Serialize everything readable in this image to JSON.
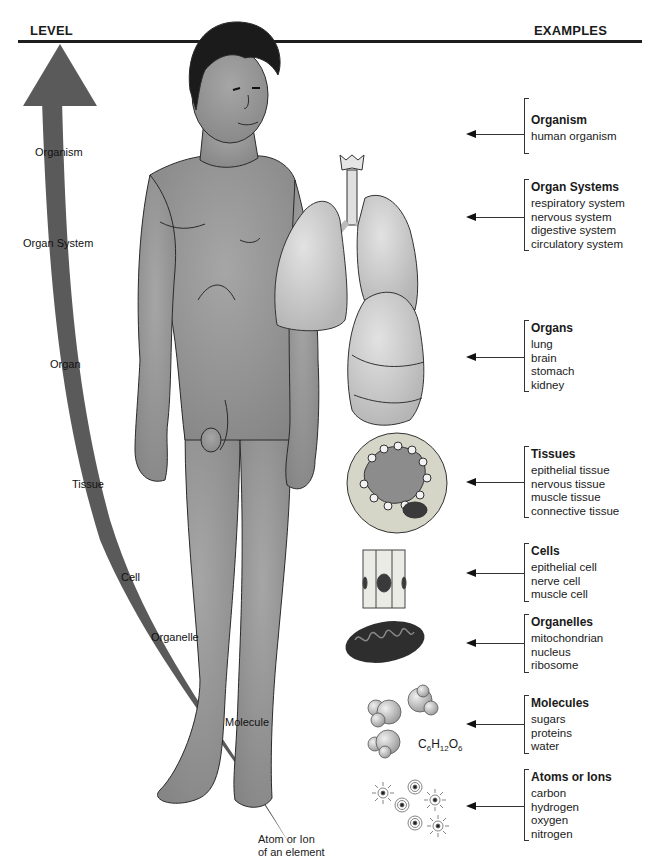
{
  "header": {
    "level_label": "LEVEL",
    "examples_label": "EXAMPLES"
  },
  "colors": {
    "rule": "#1e1e1e",
    "arrow_band": "#5a5a5a",
    "skin": "#8c8c8c",
    "organ": "#bdbdbd",
    "hair": "#1b1b1b",
    "text": "#1a1a1a"
  },
  "levels": [
    {
      "label": "Organism"
    },
    {
      "label": "Organ System"
    },
    {
      "label": "Organ"
    },
    {
      "label": "Tissue"
    },
    {
      "label": "Cell"
    },
    {
      "label": "Organelle"
    },
    {
      "label": "Molecule"
    },
    {
      "label": "Atom or Ion",
      "label_line2": "of an element"
    }
  ],
  "examples": [
    {
      "title": "Organism",
      "items": [
        "human organism"
      ]
    },
    {
      "title": "Organ Systems",
      "items": [
        "respiratory system",
        "nervous system",
        "digestive system",
        "circulatory system"
      ]
    },
    {
      "title": "Organs",
      "items": [
        "lung",
        "brain",
        "stomach",
        "kidney"
      ]
    },
    {
      "title": "Tissues",
      "items": [
        "epithelial tissue",
        "nervous tissue",
        "muscle tissue",
        "connective tissue"
      ]
    },
    {
      "title": "Cells",
      "items": [
        "epithelial cell",
        "nerve cell",
        "muscle cell"
      ]
    },
    {
      "title": "Organelles",
      "items": [
        "mitochondrian",
        "nucleus",
        "ribosome"
      ]
    },
    {
      "title": "Molecules",
      "items": [
        "sugars",
        "proteins",
        "water"
      ]
    },
    {
      "title": "Atoms or Ions",
      "items": [
        "carbon",
        "hydrogen",
        "oxygen",
        "nitrogen"
      ]
    }
  ],
  "formula": {
    "c": "C",
    "c_n": "6",
    "h": "H",
    "h_n": "12",
    "o": "O",
    "o_n": "6"
  },
  "icons": {
    "organism": "human-figure-icon",
    "organ_system": "respiratory-system-icon",
    "organ": "lung-icon",
    "tissue": "tissue-cross-section-icon",
    "cell": "epithelial-cell-icon",
    "organelle": "mitochondrion-icon",
    "molecule": "molecule-spheres-icon",
    "atom": "atom-icon"
  }
}
